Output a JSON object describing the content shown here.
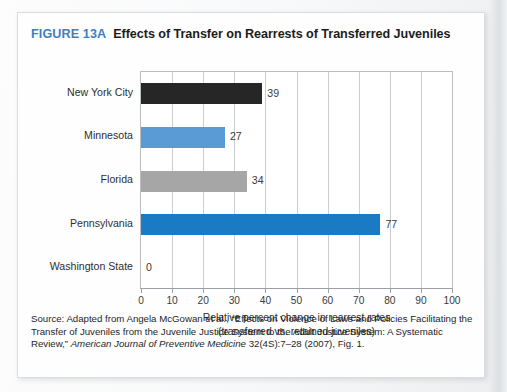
{
  "figure": {
    "number": "FIGURE 13A",
    "title": "Effects of Transfer on Rearrests of Transferred Juveniles"
  },
  "colors": {
    "figure_number_blue": "#3d7fbf",
    "bar_black": "#262626",
    "bar_light_blue": "#5b9bd5",
    "bar_gray": "#a6a6a6",
    "bar_blue": "#1a7ac4",
    "gridline": "#c9ced3",
    "card_background": "#fefeff"
  },
  "chart_data": {
    "type": "bar",
    "orientation": "horizontal",
    "title": "Effects of Transfer on Rearrests of Transferred Juveniles",
    "categories": [
      "New York City",
      "Minnesota",
      "Florida",
      "Pennsylvania",
      "Washington State"
    ],
    "values": [
      39,
      27,
      34,
      77,
      0
    ],
    "value_labels": [
      "39",
      "27",
      "34",
      "77",
      "0"
    ],
    "bar_colors": [
      "#262626",
      "#5b9bd5",
      "#a6a6a6",
      "#1a7ac4",
      "#1a7ac4"
    ],
    "xlabel": "Relative percent change in rearrest rates",
    "xlabel_line2": "(transferred vs. retained juveniles)",
    "ylabel": "",
    "xlim": [
      0,
      100
    ],
    "xticks": [
      0,
      10,
      20,
      30,
      40,
      50,
      60,
      70,
      80,
      90,
      100
    ],
    "xtick_labels": [
      "0",
      "10",
      "20",
      "30",
      "40",
      "50",
      "60",
      "70",
      "80",
      "90",
      "100"
    ],
    "grid": true,
    "grid_axis": "x",
    "legend": false
  },
  "source": {
    "line1": "Source: Adapted from Angela McGowan et al., “Effects on Violence of Laws and Policies Facilitating",
    "line2": "the Transfer of Juveniles from the Juvenile Justice System to the Adult Justice System: A Systematic",
    "line3_prefix": "Review,” ",
    "line3_journal": "American Journal of Preventive Medicine",
    "line3_suffix": " 32(4S):7–28 (2007), Fig. 1."
  }
}
